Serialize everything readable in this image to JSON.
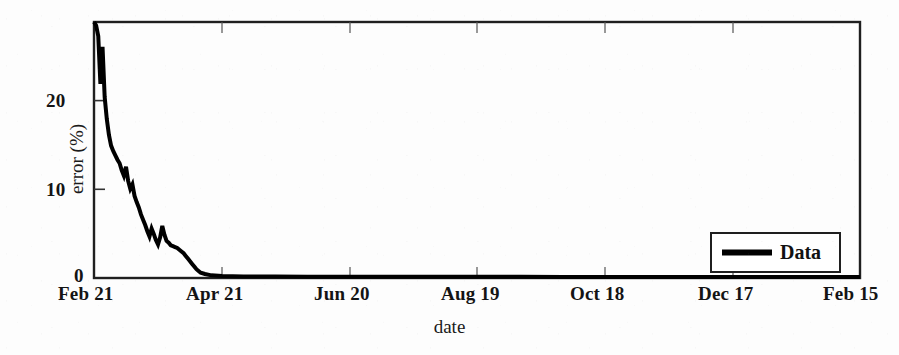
{
  "chart_data": {
    "type": "line",
    "title": "",
    "subtitle": "",
    "xlabel": "date",
    "ylabel": "error (%)",
    "grid": false,
    "legend_position": "bottom-right",
    "xlim": [
      0,
      359
    ],
    "ylim": [
      0,
      29
    ],
    "ytick_values": [
      0,
      10,
      20
    ],
    "ytick_labels": [
      "0",
      "10",
      "20"
    ],
    "xtick_values": [
      0,
      59,
      119,
      179,
      239,
      299,
      359
    ],
    "xtick_labels": [
      "Feb 21",
      "Apr 21",
      "Jun 20",
      "Aug 19",
      "Oct 18",
      "Dec 17",
      "Feb 15"
    ],
    "series": [
      {
        "name": "Data",
        "color": "#000000",
        "linewidth": 4,
        "x": [
          0,
          1,
          2,
          3,
          4,
          5,
          6,
          7,
          8,
          9,
          10,
          11,
          12,
          13,
          14,
          15,
          16,
          17,
          18,
          19,
          20,
          21,
          22,
          23,
          24,
          25,
          26,
          27,
          28,
          29,
          30,
          31,
          32,
          33,
          34,
          35,
          36,
          37,
          38,
          39,
          40,
          41,
          42,
          43,
          44,
          45,
          46,
          47,
          48,
          49,
          50,
          52,
          55,
          60,
          70,
          85,
          100,
          120,
          140,
          160,
          180,
          200,
          220,
          240,
          260,
          280,
          300,
          320,
          340,
          359
        ],
        "y": [
          29.0,
          28.6,
          27.4,
          22.0,
          26.2,
          20.5,
          18.0,
          16.2,
          15.0,
          14.4,
          13.9,
          13.4,
          13.0,
          12.2,
          11.6,
          12.6,
          11.0,
          10.1,
          10.6,
          9.3,
          8.6,
          8.0,
          7.2,
          6.6,
          6.0,
          5.3,
          4.7,
          5.6,
          5.0,
          4.3,
          3.8,
          4.6,
          5.9,
          4.9,
          4.2,
          4.0,
          3.7,
          3.6,
          3.5,
          3.4,
          3.2,
          3.0,
          2.8,
          2.5,
          2.2,
          1.9,
          1.6,
          1.3,
          1.0,
          0.8,
          0.6,
          0.45,
          0.3,
          0.22,
          0.18,
          0.16,
          0.15,
          0.14,
          0.14,
          0.13,
          0.13,
          0.13,
          0.12,
          0.12,
          0.12,
          0.12,
          0.11,
          0.11,
          0.11,
          0.11
        ]
      }
    ],
    "annotations": [],
    "note": "Exponential decay of error from ~29% at Feb 21 to near 0% by late March, flat thereafter through Feb 15."
  },
  "axes": {
    "ylabel": "error (%)",
    "xlabel": "date",
    "ytick_labels": [
      "20",
      "10",
      "0"
    ],
    "xtick_labels": [
      "Feb 21",
      "Apr 21",
      "Jun 20",
      "Aug 19",
      "Oct 18",
      "Dec 17",
      "Feb 15"
    ],
    "frame_color": "#1a1a1a"
  },
  "legend": {
    "entries": [
      {
        "label": "Data",
        "color": "#000000"
      }
    ]
  }
}
